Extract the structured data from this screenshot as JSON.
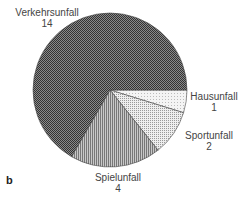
{
  "panel_label": "b",
  "chart_data": {
    "type": "pie",
    "title": "",
    "categories": [
      "Hausunfall",
      "Sportunfall",
      "Spielunfall",
      "Verkehrsunfall"
    ],
    "values": [
      1,
      2,
      4,
      14
    ],
    "total": 21,
    "start_angle_deg": 0,
    "direction": "clockwise",
    "fills": [
      "#e6e6e6",
      "#d2d2d2",
      "#a8a8a8",
      "#6a6a6a"
    ]
  },
  "labels": [
    {
      "name": "Hausunfall",
      "value": "1"
    },
    {
      "name": "Sportunfall",
      "value": "2"
    },
    {
      "name": "Spielunfall",
      "value": "4"
    },
    {
      "name": "Verkehrsunfall",
      "value": "14"
    }
  ]
}
